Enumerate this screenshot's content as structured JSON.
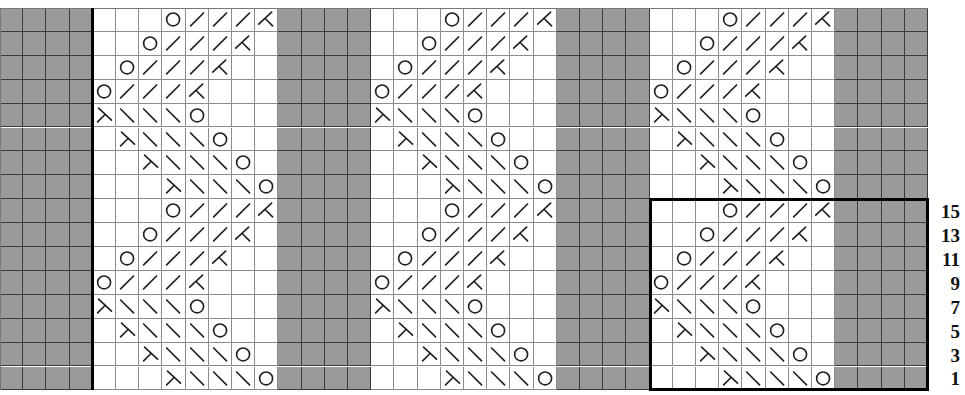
{
  "chart_title": "Knitting lace chart",
  "grid": {
    "columns": 40,
    "rows": 16,
    "cell_width": 23.2,
    "cell_height": 23.9,
    "colors": {
      "no_stitch": "#9a9a9a",
      "knit": "#ffffff",
      "grid_line": "#6a6a6a",
      "border": "#000000"
    }
  },
  "layout": {
    "panels": [
      {
        "type": "no_stitch",
        "start_col": 0,
        "width": 4
      },
      {
        "type": "pattern",
        "start_col": 4,
        "width": 8
      },
      {
        "type": "no_stitch",
        "start_col": 12,
        "width": 4
      },
      {
        "type": "pattern",
        "start_col": 16,
        "width": 8
      },
      {
        "type": "no_stitch",
        "start_col": 24,
        "width": 4
      },
      {
        "type": "pattern",
        "start_col": 28,
        "width": 8
      },
      {
        "type": "no_stitch",
        "start_col": 36,
        "width": 4
      }
    ],
    "thick_vertical_line_col": 4,
    "repeat_box": {
      "start_col": 28,
      "end_col": 40,
      "start_row": 8,
      "end_row": 16
    }
  },
  "legend_symbols": {
    "O": "yarn-over",
    "/": "right-slant-decrease",
    "\\": "left-slant-decrease",
    "K": "right-leaning-double-decrease",
    "L": "left-leaning-double-decrease",
    "": "knit"
  },
  "pattern_rows_top_to_bottom": [
    [
      "",
      "",
      "",
      "O",
      "/",
      "/",
      "/",
      "K"
    ],
    [
      "",
      "",
      "O",
      "/",
      "/",
      "/",
      "K",
      ""
    ],
    [
      "",
      "O",
      "/",
      "/",
      "/",
      "K",
      "",
      ""
    ],
    [
      "O",
      "/",
      "/",
      "/",
      "K",
      "",
      "",
      ""
    ],
    [
      "L",
      "\\",
      "\\",
      "\\",
      "O",
      "",
      "",
      ""
    ],
    [
      "",
      "L",
      "\\",
      "\\",
      "\\",
      "O",
      "",
      ""
    ],
    [
      "",
      "",
      "L",
      "\\",
      "\\",
      "\\",
      "O",
      ""
    ],
    [
      "",
      "",
      "",
      "L",
      "\\",
      "\\",
      "\\",
      "O"
    ],
    [
      "",
      "",
      "",
      "O",
      "/",
      "/",
      "/",
      "K"
    ],
    [
      "",
      "",
      "O",
      "/",
      "/",
      "/",
      "K",
      ""
    ],
    [
      "",
      "O",
      "/",
      "/",
      "/",
      "K",
      "",
      ""
    ],
    [
      "O",
      "/",
      "/",
      "/",
      "K",
      "",
      "",
      ""
    ],
    [
      "L",
      "\\",
      "\\",
      "\\",
      "O",
      "",
      "",
      ""
    ],
    [
      "",
      "L",
      "\\",
      "\\",
      "\\",
      "O",
      "",
      ""
    ],
    [
      "",
      "",
      "L",
      "\\",
      "\\",
      "\\",
      "O",
      ""
    ],
    [
      "",
      "",
      "",
      "L",
      "\\",
      "\\",
      "\\",
      "O"
    ]
  ],
  "row_numbers": [
    {
      "row_index": 8,
      "label": "15"
    },
    {
      "row_index": 9,
      "label": "13"
    },
    {
      "row_index": 10,
      "label": "11"
    },
    {
      "row_index": 11,
      "label": "9"
    },
    {
      "row_index": 12,
      "label": "7"
    },
    {
      "row_index": 13,
      "label": "5"
    },
    {
      "row_index": 14,
      "label": "3"
    },
    {
      "row_index": 15,
      "label": "1"
    }
  ]
}
